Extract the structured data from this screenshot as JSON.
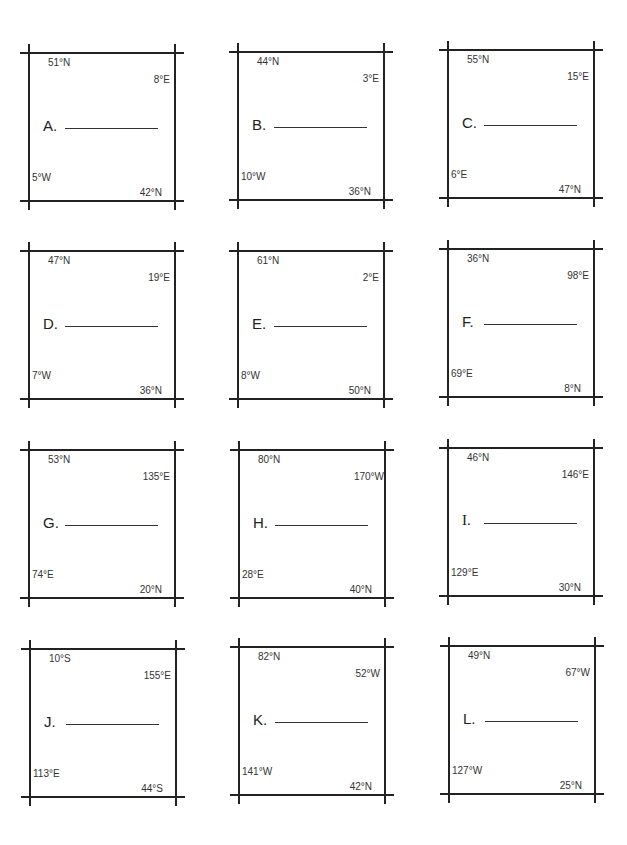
{
  "worksheet": {
    "boxes": [
      {
        "letter": "A.",
        "top_lat": "51°N",
        "right_lon": "8°E",
        "left_lon": "5°W",
        "bottom_lat": "42°N",
        "x": 28,
        "y": 52
      },
      {
        "letter": "B.",
        "top_lat": "44°N",
        "right_lon": "3°E",
        "left_lon": "10°W",
        "bottom_lat": "36°N",
        "x": 237,
        "y": 51
      },
      {
        "letter": "C.",
        "top_lat": "55°N",
        "right_lon": "15°E",
        "left_lon": "6°E",
        "bottom_lat": "47°N",
        "x": 447,
        "y": 49
      },
      {
        "letter": "D.",
        "top_lat": "47°N",
        "right_lon": "19°E",
        "left_lon": "7°W",
        "bottom_lat": "36°N",
        "x": 28,
        "y": 250
      },
      {
        "letter": "E.",
        "top_lat": "61°N",
        "right_lon": "2°E",
        "left_lon": "8°W",
        "bottom_lat": "50°N",
        "x": 237,
        "y": 250
      },
      {
        "letter": "F.",
        "top_lat": "36°N",
        "right_lon": "98°E",
        "left_lon": "69°E",
        "bottom_lat": "8°N",
        "x": 447,
        "y": 248
      },
      {
        "letter": "G.",
        "top_lat": "53°N",
        "right_lon": "135°E",
        "left_lon": "74°E",
        "bottom_lat": "20°N",
        "x": 28,
        "y": 449
      },
      {
        "letter": "H.",
        "top_lat": "80°N",
        "right_lon": "170°W",
        "left_lon": "28°E",
        "bottom_lat": "40°N",
        "x": 238,
        "y": 449
      },
      {
        "letter": "I.",
        "top_lat": "46°N",
        "right_lon": "146°E",
        "left_lon": "129°E",
        "bottom_lat": "30°N",
        "x": 447,
        "y": 447
      },
      {
        "letter": "J.",
        "top_lat": "10°S",
        "right_lon": "155°E",
        "left_lon": "113°E",
        "bottom_lat": "44°S",
        "x": 29,
        "y": 648
      },
      {
        "letter": "K.",
        "top_lat": "82°N",
        "right_lon": "52°W",
        "left_lon": "141°W",
        "bottom_lat": "42°N",
        "x": 238,
        "y": 646
      },
      {
        "letter": "L.",
        "top_lat": "49°N",
        "right_lon": "67°W",
        "left_lon": "127°W",
        "bottom_lat": "25°N",
        "x": 448,
        "y": 645
      }
    ]
  }
}
